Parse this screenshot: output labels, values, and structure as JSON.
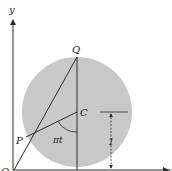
{
  "figure": {
    "axes": {
      "x_label": "x",
      "y_label": "y",
      "origin_label": "O"
    },
    "points": {
      "P": "P",
      "Q": "Q",
      "C": "C"
    },
    "angle_label": "πt",
    "dimension_label": "1",
    "colors": {
      "disk": "#c8c8c8",
      "line": "#2a2a2a",
      "background": "#ffffff"
    }
  }
}
